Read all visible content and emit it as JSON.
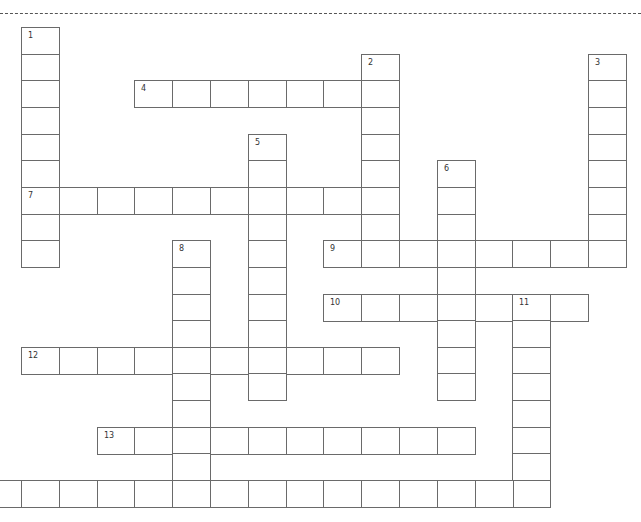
{
  "page": {
    "separator": "dashed-line"
  },
  "crossword": {
    "words": [
      {
        "number": "1",
        "direction": "down",
        "row": 0,
        "col": 1,
        "length": 9
      },
      {
        "number": "2",
        "direction": "down",
        "row": 1,
        "col": 10,
        "length": 8
      },
      {
        "number": "3",
        "direction": "down",
        "row": 1,
        "col": 16,
        "length": 8
      },
      {
        "number": "4",
        "direction": "across",
        "row": 2,
        "col": 4,
        "length": 7
      },
      {
        "number": "5",
        "direction": "down",
        "row": 4,
        "col": 7,
        "length": 10
      },
      {
        "number": "6",
        "direction": "down",
        "row": 5,
        "col": 12,
        "length": 9
      },
      {
        "number": "7",
        "direction": "across",
        "row": 6,
        "col": 1,
        "length": 10
      },
      {
        "number": "8",
        "direction": "down",
        "row": 8,
        "col": 5,
        "length": 10
      },
      {
        "number": "9",
        "direction": "across",
        "row": 8,
        "col": 9,
        "length": 8
      },
      {
        "number": "10",
        "direction": "across",
        "row": 10,
        "col": 9,
        "length": 7
      },
      {
        "number": "11",
        "direction": "down",
        "row": 10,
        "col": 14,
        "length": 8
      },
      {
        "number": "12",
        "direction": "across",
        "row": 12,
        "col": 1,
        "length": 10
      },
      {
        "number": "13",
        "direction": "across",
        "row": 15,
        "col": 3,
        "length": 10
      },
      {
        "number": "",
        "direction": "across",
        "row": 17,
        "col": 0,
        "length": 15
      }
    ]
  }
}
